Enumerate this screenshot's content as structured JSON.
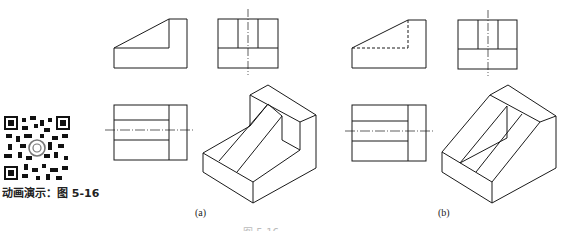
{
  "qr": {
    "icon": "qr-code-icon",
    "caption": "动画演示：图 5-16"
  },
  "figures": [
    {
      "id": "a",
      "label": "(a)",
      "views": [
        "front-view",
        "side-view",
        "top-view",
        "isometric-view"
      ],
      "hidden_lines_in_front_view": false
    },
    {
      "id": "b",
      "label": "(b)",
      "views": [
        "front-view",
        "side-view",
        "top-view",
        "isometric-view"
      ],
      "hidden_lines_in_front_view": true
    }
  ],
  "caption": {
    "text": "图 5-16 ……"
  },
  "colors": {
    "line": "#1a1a1a",
    "background": "#ffffff"
  }
}
